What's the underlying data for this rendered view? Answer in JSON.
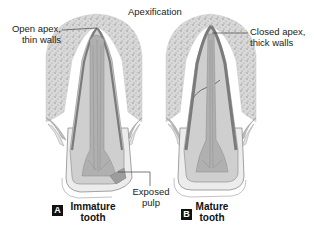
{
  "title": "Apexification",
  "colors": {
    "bone": "#d6d6d6",
    "bone_speckle": "#8a8a8a",
    "dentin": "#c9c9c9",
    "root_wall": "#7b7b7b",
    "pulp": "#a9a9a9",
    "enamel": "#e6e6e6",
    "crown_outline": "#9a9a9a",
    "leader_line": "#444444",
    "badge_bg": "#111111",
    "badge_text": "#ffffff"
  },
  "teeth": [
    {
      "id": "A",
      "badge": "A",
      "caption_line1": "Immature",
      "caption_line2": "tooth",
      "callout_line1": "Open apex,",
      "callout_line2": "thin walls"
    },
    {
      "id": "B",
      "badge": "B",
      "caption_line1": "Mature",
      "caption_line2": "tooth",
      "callout_line1": "Closed apex,",
      "callout_line2": "thick walls"
    }
  ],
  "exposed_pulp": {
    "line1": "Exposed",
    "line2": "pulp"
  }
}
